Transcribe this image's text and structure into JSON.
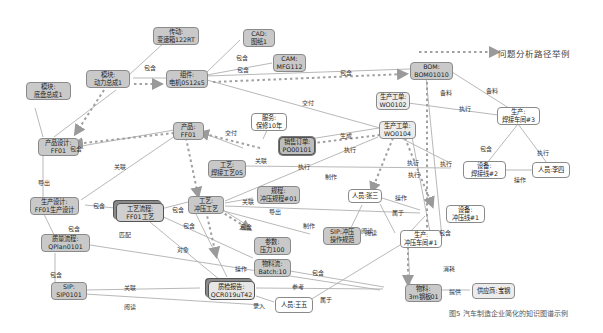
{
  "legend": {
    "label": "问题分析路径举例",
    "line_style": "dashed-arrow"
  },
  "caption": "图5  汽车制造企业简化的知识图谱示例",
  "nodes": {
    "transmission": {
      "l1": "传动:",
      "l2": "变速箱122RT"
    },
    "cad": {
      "l1": "CAD:",
      "l2": "图纸1"
    },
    "cam": {
      "l1": "CAM:",
      "l2": "MFG112"
    },
    "module_power": {
      "l1": "模块:",
      "l2": "动力总成1"
    },
    "component": {
      "l1": "组件:",
      "l2": "电机0512s5"
    },
    "module_chassis": {
      "l1": "模块:",
      "l2": "底盘总成1"
    },
    "bom": {
      "l1": "BOM:",
      "l2": "BOM01010"
    },
    "wo0102": {
      "l1": "生产工单:",
      "l2": "WO0102"
    },
    "workshop3": {
      "l1": "生产:",
      "l2": "焊接车间#3"
    },
    "service": {
      "l1": "服务:",
      "l2": "保修10年"
    },
    "product": {
      "l1": "产品:",
      "l2": "FF01"
    },
    "sales_order": {
      "l1": "销售订单:",
      "l2": "PO00101"
    },
    "wo0104": {
      "l1": "生产工单:",
      "l2": "WO0104"
    },
    "product_design": {
      "l1": "产品设计:",
      "l2": "FF01"
    },
    "weld_line2": {
      "l1": "设备:",
      "l2": "焊接线#2"
    },
    "person_lisi": {
      "l1": "人员:李四"
    },
    "craft_weld": {
      "l1": "工艺:",
      "l2": "焊接工艺05"
    },
    "spec": {
      "l1": "规程:",
      "l2": "冲压规程#01"
    },
    "person_zhangsan": {
      "l1": "人员:张三"
    },
    "prod_design": {
      "l1": "生产设计:",
      "l2": "FF01生产设计"
    },
    "process_flow": {
      "l1": "工艺流程:",
      "l2": "FF01工艺"
    },
    "craft_stamp": {
      "l1": "工艺:",
      "l2": "冲压工艺"
    },
    "stamp_line1": {
      "l1": "设备:",
      "l2": "冲压线#1"
    },
    "sip_stamp": {
      "l1": "SIP:冲压",
      "l2": "操作规范"
    },
    "stamp_workshop1": {
      "l1": "生产:",
      "l2": "冲压车间#1"
    },
    "quality_flow": {
      "l1": "质量流程:",
      "l2": "QPlan0101"
    },
    "param": {
      "l1": "参数:",
      "l2": "压力100"
    },
    "material_flow": {
      "l1": "物料流:",
      "l2": "Batch:10"
    },
    "sip0101": {
      "l1": "SIP:",
      "l2": "SIP0101"
    },
    "qc_report": {
      "l1": "质检报告:",
      "l2": "QCR019uT42"
    },
    "person_wangwu": {
      "l1": "人员:王五"
    },
    "material": {
      "l1": "物料:",
      "l2": "3m钢板01"
    },
    "supplier": {
      "l1": "供应商:宝钢"
    }
  },
  "edges": [
    {
      "from": "module_power",
      "to": "transmission",
      "label": ""
    },
    {
      "from": "module_power",
      "to": "component",
      "label": "包含"
    },
    {
      "from": "component",
      "to": "cad",
      "label": "包含"
    },
    {
      "from": "component",
      "to": "cam",
      "label": "包含"
    },
    {
      "from": "component",
      "to": "bom",
      "label": "包含"
    },
    {
      "from": "component",
      "to": "wo0104",
      "label": "交付"
    },
    {
      "from": "bom",
      "to": "workshop3",
      "label": "备料"
    },
    {
      "from": "bom",
      "to": "stamp_workshop1",
      "label": "备料"
    },
    {
      "from": "wo0102",
      "to": "workshop3",
      "label": "执行"
    },
    {
      "from": "workshop3",
      "to": "weld_line2",
      "label": "包含"
    },
    {
      "from": "workshop3",
      "to": "person_lisi",
      "label": "执行"
    },
    {
      "from": "weld_line2",
      "to": "person_lisi",
      "label": "操作"
    },
    {
      "from": "product",
      "to": "sales_order",
      "label": "交付"
    },
    {
      "from": "product",
      "to": "product_design",
      "label": "包含"
    },
    {
      "from": "product",
      "to": "prod_design",
      "label": "关联"
    },
    {
      "from": "service",
      "to": "sales_order",
      "label": ""
    },
    {
      "from": "sales_order",
      "to": "wo0104",
      "label": "生成"
    },
    {
      "from": "wo0104",
      "to": "weld_line2",
      "label": "执行"
    },
    {
      "from": "wo0104",
      "to": "stamp_line1",
      "label": "执行"
    },
    {
      "from": "craft_weld",
      "to": "weld_line2",
      "label": "制作"
    },
    {
      "from": "craft_stamp",
      "to": "sales_order",
      "label": "执行"
    },
    {
      "from": "craft_stamp",
      "to": "spec",
      "label": "关联"
    },
    {
      "from": "craft_stamp",
      "to": "stamp_line1",
      "label": "导出"
    },
    {
      "from": "craft_stamp",
      "to": "param",
      "label": "包含"
    },
    {
      "from": "craft_stamp",
      "to": "sip_stamp",
      "label": "制作"
    },
    {
      "from": "person_zhangsan",
      "to": "stamp_line1",
      "label": "操作"
    },
    {
      "from": "person_zhangsan",
      "to": "stamp_workshop1",
      "label": "属于"
    },
    {
      "from": "person_zhangsan",
      "to": "sip_stamp",
      "label": "阅读"
    },
    {
      "from": "stamp_line1",
      "to": "stamp_workshop1",
      "label": "包含"
    },
    {
      "from": "stamp_workshop1",
      "to": "material",
      "label": "消耗"
    },
    {
      "from": "material",
      "to": "supplier",
      "label": "提供"
    },
    {
      "from": "module_chassis",
      "to": "product_design",
      "label": ""
    },
    {
      "from": "module_power",
      "to": "product_design",
      "label": "包含"
    },
    {
      "from": "product_design",
      "to": "prod_design",
      "label": "导出"
    },
    {
      "from": "prod_design",
      "to": "process_flow",
      "label": "包含"
    },
    {
      "from": "prod_design",
      "to": "quality_flow",
      "label": "包含"
    },
    {
      "from": "process_flow",
      "to": "craft_stamp",
      "label": "包含"
    },
    {
      "from": "process_flow",
      "to": "qc_report",
      "label": "对象"
    },
    {
      "from": "process_flow",
      "to": "material_flow",
      "label": "包含"
    },
    {
      "from": "quality_flow",
      "to": "sip0101",
      "label": "包含"
    },
    {
      "from": "quality_flow",
      "to": "material",
      "label": ""
    },
    {
      "from": "sip0101",
      "to": "qc_report",
      "label": "关联"
    },
    {
      "from": "sip0101",
      "to": "person_wangwu",
      "label": "阅读"
    },
    {
      "from": "craft_stamp",
      "to": "qc_report",
      "label": "操作"
    },
    {
      "from": "material_flow",
      "to": "material",
      "label": "包含"
    },
    {
      "from": "qc_report",
      "to": "material",
      "label": "参考"
    },
    {
      "from": "qc_report",
      "to": "person_wangwu",
      "label": "录入"
    },
    {
      "from": "person_wangwu",
      "to": "stamp_workshop1",
      "label": "属于"
    }
  ],
  "edge_labels": [
    {
      "text": "包含",
      "x": 144,
      "y": 63
    },
    {
      "text": "包含",
      "x": 236,
      "y": 53
    },
    {
      "text": "包含",
      "x": 237,
      "y": 65
    },
    {
      "text": "包含",
      "x": 340,
      "y": 68
    },
    {
      "text": "交付",
      "x": 302,
      "y": 98
    },
    {
      "text": "备料",
      "x": 440,
      "y": 88
    },
    {
      "text": "备料",
      "x": 486,
      "y": 86
    },
    {
      "text": "执行",
      "x": 459,
      "y": 104
    },
    {
      "text": "执行",
      "x": 537,
      "y": 148
    },
    {
      "text": "包含",
      "x": 480,
      "y": 144
    },
    {
      "text": "操作",
      "x": 514,
      "y": 175
    },
    {
      "text": "交付",
      "x": 225,
      "y": 128
    },
    {
      "text": "关联",
      "x": 255,
      "y": 156
    },
    {
      "text": "生成",
      "x": 340,
      "y": 131
    },
    {
      "text": "执行",
      "x": 344,
      "y": 145
    },
    {
      "text": "执行",
      "x": 298,
      "y": 162
    },
    {
      "text": "制作",
      "x": 325,
      "y": 172
    },
    {
      "text": "执行",
      "x": 407,
      "y": 158
    },
    {
      "text": "执行",
      "x": 440,
      "y": 159
    },
    {
      "text": "执行",
      "x": 408,
      "y": 170
    },
    {
      "text": "包含",
      "x": 70,
      "y": 144
    },
    {
      "text": "关联",
      "x": 114,
      "y": 162
    },
    {
      "text": "导出",
      "x": 38,
      "y": 178
    },
    {
      "text": "包含",
      "x": 93,
      "y": 201
    },
    {
      "text": "包含",
      "x": 68,
      "y": 224
    },
    {
      "text": "匹配",
      "x": 119,
      "y": 230
    },
    {
      "text": "包含",
      "x": 172,
      "y": 205
    },
    {
      "text": "包含",
      "x": 183,
      "y": 221
    },
    {
      "text": "对象",
      "x": 177,
      "y": 245
    },
    {
      "text": "关联",
      "x": 242,
      "y": 197
    },
    {
      "text": "导出",
      "x": 269,
      "y": 207
    },
    {
      "text": "包含",
      "x": 240,
      "y": 222
    },
    {
      "text": "制作",
      "x": 303,
      "y": 221
    },
    {
      "text": "操作",
      "x": 235,
      "y": 264
    },
    {
      "text": "包含",
      "x": 312,
      "y": 268
    },
    {
      "text": "参考",
      "x": 292,
      "y": 282
    },
    {
      "text": "录入",
      "x": 253,
      "y": 301
    },
    {
      "text": "属于",
      "x": 320,
      "y": 295
    },
    {
      "text": "操作",
      "x": 395,
      "y": 193
    },
    {
      "text": "属于",
      "x": 392,
      "y": 208
    },
    {
      "text": "阅读",
      "x": 361,
      "y": 226
    },
    {
      "text": "阅读",
      "x": 365,
      "y": 228
    },
    {
      "text": "包含",
      "x": 439,
      "y": 228
    },
    {
      "text": "消耗",
      "x": 443,
      "y": 264
    },
    {
      "text": "提供",
      "x": 449,
      "y": 287
    },
    {
      "text": "包含",
      "x": 50,
      "y": 270
    },
    {
      "text": "关联",
      "x": 124,
      "y": 283
    },
    {
      "text": "阅读",
      "x": 124,
      "y": 302
    }
  ]
}
